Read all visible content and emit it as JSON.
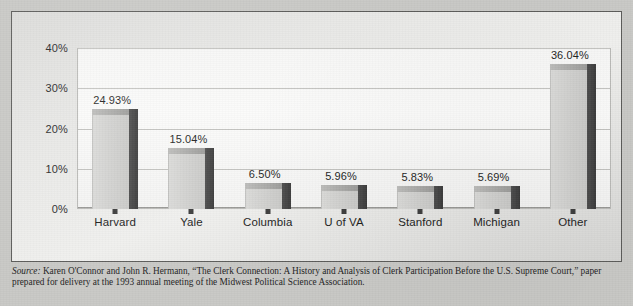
{
  "figure": {
    "source_label": "Source:",
    "source_text": " Karen O'Connor and John R. Hermann, “The Clerk Connection: A History and Analysis of Clerk Participation Before the U.S. Supreme Court,” paper prepared for delivery at the 1993 annual meeting of the Midwest Political Science Association."
  },
  "colors": {
    "paper": "#c9c9c6",
    "figure_bg": "#eaeae8",
    "plot_bg": "#f8f8f7",
    "bar_front": "#d2d2d0",
    "bar_side": "#434343",
    "gridline": "#c3c3c0",
    "border": "#5d5d5b",
    "text": "#1f1f1f"
  },
  "chart_data": {
    "type": "bar",
    "title": "",
    "subtitle": "",
    "xlabel": "",
    "ylabel": "",
    "categories": [
      "Harvard",
      "Yale",
      "Columbia",
      "U of VA",
      "Stanford",
      "Michigan",
      "Other"
    ],
    "values": [
      24.93,
      15.04,
      6.5,
      5.96,
      5.83,
      5.69,
      36.04
    ],
    "value_labels": [
      "24.93%",
      "15.04%",
      "6.50%",
      "5.96%",
      "5.83%",
      "5.69%",
      "36.04%"
    ],
    "ylim": [
      0,
      40
    ],
    "yticks": [
      0,
      10,
      20,
      30,
      40
    ],
    "ytick_labels": [
      "0%",
      "10%",
      "20%",
      "30%",
      "40%"
    ],
    "grid": true,
    "legend": null,
    "annotations": []
  }
}
